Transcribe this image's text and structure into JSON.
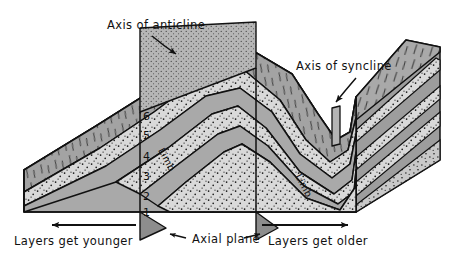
{
  "figure": {
    "kind": "geologic-block-diagram",
    "background": "#ffffff",
    "ink": "#111111"
  },
  "annotations": {
    "axis_anticline": "Axis of anticline",
    "axis_syncline": "Axis of syncline",
    "axial_plane": "Axial plane",
    "layers_younger": "Layers get younger",
    "layers_older": "Layers get older",
    "limb_left": "Limb",
    "limb_right": "Limb"
  },
  "bed_numbers": [
    "6",
    "5",
    "4",
    "3",
    "2",
    "1"
  ],
  "bed_number_note": "Numbered oldest (1) at core of anticline to youngest (6) outward",
  "colors": {
    "rock_gray": "#a9a9a9",
    "rock_gray_dark": "#9a9a9a",
    "sand_light": "#d9d9d9",
    "sand_mid": "#c4c4c4",
    "shade_side": "#8f8f8f",
    "axial_fin": "#b4b4b4",
    "outline": "#111111",
    "white": "#ffffff"
  },
  "textures": {
    "stipple": "dotted sandstone bed",
    "hachure": "short tick marks on eroded top surface",
    "solid": "uniform gray shale bed"
  },
  "arrows": {
    "anticline_arrow": "curved arrow pointing down-right to anticline axial fin",
    "syncline_arrow": "curved arrow pointing down-left to syncline axial fin",
    "younger_arrow": "straight arrow pointing left",
    "older_arrow": "straight arrow pointing right",
    "axial_plane_left_arrow": "short arrow pointing left",
    "axial_plane_right_arrow": "short arrow pointing right"
  }
}
